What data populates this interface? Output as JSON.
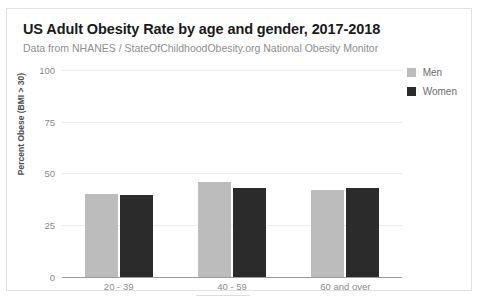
{
  "card": {
    "title": "US Adult Obesity Rate by age and gender, 2017-2018",
    "subtitle": "Data from NHANES / StateOfChildhoodObesity.org National Obesity Monitor"
  },
  "legend": {
    "position": "top-right",
    "items": [
      {
        "label": "Men",
        "color": "#bcbcbc",
        "swatch_name": "legend-swatch-men"
      },
      {
        "label": "Women",
        "color": "#2b2b2b",
        "swatch_name": "legend-swatch-women"
      }
    ]
  },
  "axes": {
    "y_title": "Percent Obese (BMI > 30)",
    "y_ticks": [
      "100",
      "75",
      "50",
      "25",
      "0"
    ],
    "x_ticks": [
      "20 - 39",
      "40 - 59",
      "60 and over"
    ]
  },
  "colors": {
    "men_bar": "#bcbcbc",
    "women_bar": "#2b2b2b",
    "gridline": "#ececec",
    "axis": "#9a9a9a",
    "title_text": "#1a1a1a",
    "subtitle_text": "#8e8e8e",
    "tick_text": "#8a8a8a",
    "card_border": "#e2e2e2"
  },
  "chart_data": {
    "type": "bar",
    "title": "US Adult Obesity Rate by age and gender, 2017-2018",
    "subtitle": "Data from NHANES / StateOfChildhoodObesity.org National Obesity Monitor",
    "xlabel": "",
    "ylabel": "Percent Obese (BMI > 30)",
    "categories": [
      "20 - 39",
      "40 - 59",
      "60 and over"
    ],
    "series": [
      {
        "name": "Men",
        "color": "#bcbcbc",
        "values": [
          40,
          46,
          42
        ]
      },
      {
        "name": "Women",
        "color": "#2b2b2b",
        "values": [
          39.7,
          43,
          43
        ]
      }
    ],
    "ylim": [
      0,
      100
    ],
    "yticks": [
      0,
      25,
      50,
      75,
      100
    ],
    "grid": true,
    "legend_position": "top-right"
  }
}
